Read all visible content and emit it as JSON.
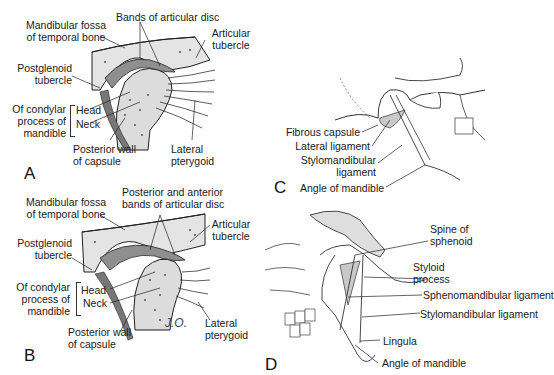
{
  "panels": {
    "A": {
      "letter": "A",
      "labels": {
        "mandibular_fossa_1": "Mandibular fossa",
        "mandibular_fossa_2": "of temporal bone",
        "bands_disc": "Bands of articular disc",
        "articular_tubercle_1": "Articular",
        "articular_tubercle_2": "tubercle",
        "postglenoid_1": "Postglenoid",
        "postglenoid_2": "tubercle",
        "condylar_1": "Of condylar",
        "condylar_2": "process of",
        "condylar_3": "mandible",
        "head": "Head",
        "neck": "Neck",
        "posterior_wall_1": "Posterior wall",
        "posterior_wall_2": "of capsule",
        "lateral_pterygoid_1": "Lateral",
        "lateral_pterygoid_2": "pterygoid"
      }
    },
    "B": {
      "letter": "B",
      "labels": {
        "mandibular_fossa_1": "Mandibular fossa",
        "mandibular_fossa_2": "of temporal bone",
        "bands_disc_1": "Posterior and anterior",
        "bands_disc_2": "bands of articular disc",
        "articular_tubercle_1": "Articular",
        "articular_tubercle_2": "tubercle",
        "postglenoid_1": "Postglenoid",
        "postglenoid_2": "tubercle",
        "condylar_1": "Of condylar",
        "condylar_2": "process of",
        "condylar_3": "mandible",
        "head": "Head",
        "neck": "Neck",
        "posterior_wall_1": "Posterior wall",
        "posterior_wall_2": "of capsule",
        "lateral_pterygoid_1": "Lateral",
        "lateral_pterygoid_2": "pterygoid",
        "signature": "J.O."
      }
    },
    "C": {
      "letter": "C",
      "labels": {
        "fibrous_capsule": "Fibrous capsule",
        "lateral_ligament": "Lateral ligament",
        "stylomandibular_1": "Stylomandibular",
        "stylomandibular_2": "ligament",
        "angle_of_mandible": "Angle of mandible"
      }
    },
    "D": {
      "letter": "D",
      "labels": {
        "spine_sphenoid_1": "Spine of",
        "spine_sphenoid_2": "sphenoid",
        "styloid_1": "Styloid",
        "styloid_2": "process",
        "sphenomandibular": "Sphenomandibular ligament",
        "stylomandibular": "Stylomandibular ligament",
        "lingula": "Lingula",
        "angle_of_mandible": "Angle of mandible"
      }
    }
  },
  "colors": {
    "ink": "#1a1a1a",
    "bone": "#e6e6e6",
    "disc": "#9a9a9a",
    "muscle": "#555555",
    "background": "#ffffff"
  }
}
